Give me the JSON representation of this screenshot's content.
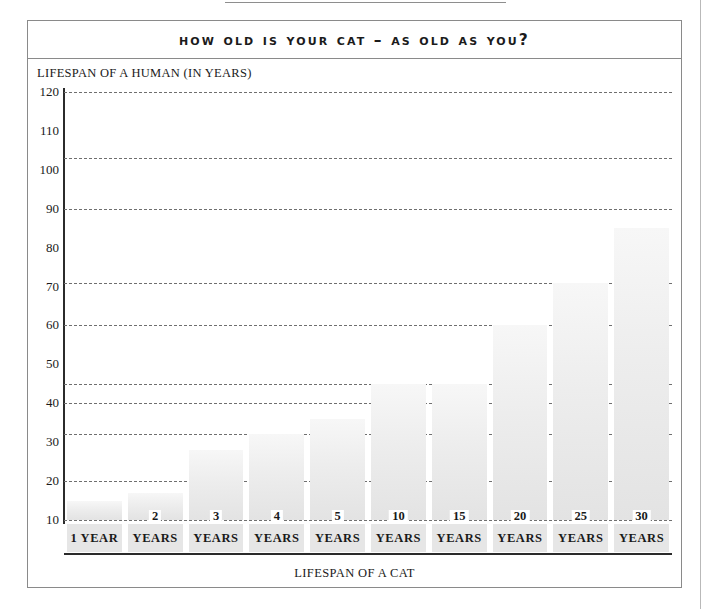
{
  "chart_data": {
    "type": "bar",
    "title": "How Old Is Your Cat – as Old as You?",
    "xlabel": "LIFESPAN OF A CAT",
    "ylabel": "LIFESPAN OF A HUMAN (IN YEARS)",
    "categories": [
      "1 YEAR",
      "2 YEARS",
      "3 YEARS",
      "4 YEARS",
      "5 YEARS",
      "10 YEARS",
      "15 YEARS",
      "20 YEARS",
      "25 YEARS",
      "30 YEARS"
    ],
    "category_numbers": [
      "",
      "2",
      "3",
      "4",
      "5",
      "10",
      "15",
      "20",
      "25",
      "30"
    ],
    "category_units": [
      "1 YEAR",
      "YEARS",
      "YEARS",
      "YEARS",
      "YEARS",
      "YEARS",
      "YEARS",
      "YEARS",
      "YEARS",
      "YEARS"
    ],
    "values": [
      15,
      17,
      28,
      32,
      36,
      45,
      45,
      60,
      71,
      85
    ],
    "ylim": [
      10,
      120
    ],
    "ytick_labels": [
      "120",
      "110",
      "100",
      "90",
      "80",
      "70",
      "60",
      "50",
      "40",
      "30",
      "20",
      "10"
    ],
    "ytick_values": [
      120,
      110,
      100,
      90,
      80,
      70,
      60,
      50,
      40,
      30,
      20,
      10
    ],
    "gridline_values": [
      120,
      103,
      90,
      71,
      60,
      45,
      40,
      32,
      20,
      10
    ],
    "grid": true,
    "legend": "none",
    "bar_color": "#e8e8e8",
    "grid_color": "#6f6f6f",
    "axis_color": "#2b2b2b"
  },
  "frame": {
    "border_color": "#8a8a8a"
  }
}
